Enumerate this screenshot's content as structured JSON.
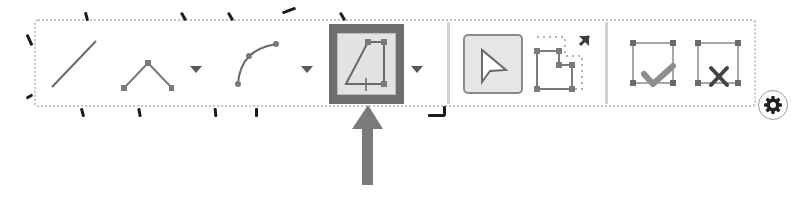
{
  "toolbar": {
    "groups": [
      {
        "name": "draw-tools",
        "tools": [
          {
            "id": "line",
            "label": "Line",
            "icon": "line-icon",
            "has_dropdown": false,
            "active": false
          },
          {
            "id": "polyline",
            "label": "Polyline",
            "icon": "polyline-icon",
            "has_dropdown": true,
            "active": false
          },
          {
            "id": "arc",
            "label": "Arc",
            "icon": "arc-icon",
            "has_dropdown": true,
            "active": false
          },
          {
            "id": "polygon",
            "label": "Polygon",
            "icon": "polygon-icon",
            "has_dropdown": true,
            "active": true
          }
        ]
      },
      {
        "name": "edit-tools",
        "tools": [
          {
            "id": "select",
            "label": "Select",
            "icon": "cursor-arrow-icon",
            "active": true
          },
          {
            "id": "edit-vertices",
            "label": "Edit Vertices",
            "icon": "edit-vertices-icon",
            "active": false
          }
        ]
      },
      {
        "name": "finish-tools",
        "tools": [
          {
            "id": "finish",
            "label": "Finish Sketch",
            "icon": "finish-sketch-check-icon"
          },
          {
            "id": "cancel",
            "label": "Cancel Sketch",
            "icon": "cancel-sketch-x-icon"
          }
        ]
      }
    ],
    "settings_icon": "gear-icon"
  },
  "annotation": {
    "arrow_target": "polygon",
    "arrow_icon": "up-arrow-icon"
  },
  "colors": {
    "highlight_frame": "#6e6e6e",
    "highlight_fill": "#e2e2e2",
    "icon_stroke": "#7a7a7a",
    "vertex": "#7a7a7a",
    "check": "#8e8e8e",
    "cross": "#444444",
    "arrow": "#7a7a7a",
    "border": "#c4c4c4"
  }
}
